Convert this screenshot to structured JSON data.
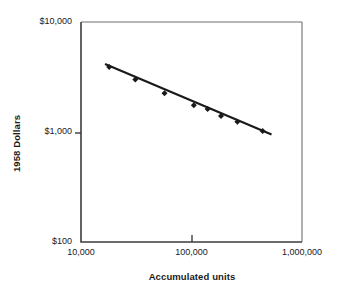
{
  "chart_data": {
    "type": "scatter",
    "title": "",
    "xlabel": "Accumulated units",
    "ylabel": "1958 Dollars",
    "xscale": "log",
    "yscale": "log",
    "xlim": [
      10000,
      1000000
    ],
    "ylim": [
      100,
      10000
    ],
    "grid": false,
    "legend": null,
    "xticks": [
      {
        "value": 10000,
        "label": "10,000"
      },
      {
        "value": 100000,
        "label": "100,000"
      },
      {
        "value": 1000000,
        "label": "1,000,000"
      }
    ],
    "yticks": [
      {
        "value": 100,
        "label": "$100"
      },
      {
        "value": 1000,
        "label": "$1,000"
      },
      {
        "value": 10000,
        "label": "$10,000"
      }
    ],
    "series": [
      {
        "name": "Observed unit cost",
        "marker": "diamond",
        "color": "#1a1a1a",
        "points": [
          {
            "x": 18000,
            "y": 3900
          },
          {
            "x": 31000,
            "y": 3000
          },
          {
            "x": 57000,
            "y": 2250
          },
          {
            "x": 105000,
            "y": 1750
          },
          {
            "x": 140000,
            "y": 1620
          },
          {
            "x": 185000,
            "y": 1400
          },
          {
            "x": 260000,
            "y": 1240
          },
          {
            "x": 440000,
            "y": 1020
          }
        ]
      },
      {
        "name": "Fitted learning curve",
        "type": "line",
        "color": "#1a1a1a",
        "points": [
          {
            "x": 16500,
            "y": 4150
          },
          {
            "x": 530000,
            "y": 950
          }
        ]
      }
    ]
  },
  "axes": {
    "x_title": "Accumulated units",
    "y_title": "1958 Dollars"
  }
}
